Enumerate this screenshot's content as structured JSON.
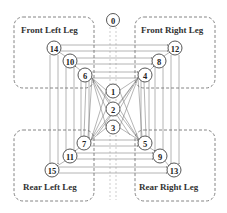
{
  "diagram": {
    "title": "",
    "legs": [
      {
        "id": "front_left",
        "label": "Front Left Leg",
        "nodes": [
          14,
          10,
          6
        ]
      },
      {
        "id": "front_right",
        "label": "Front Right Leg",
        "nodes": [
          12,
          8,
          4
        ]
      },
      {
        "id": "rear_left",
        "label": "Rear Left Leg",
        "nodes": [
          15,
          11,
          7
        ]
      },
      {
        "id": "rear_right",
        "label": "Rear Right Leg",
        "nodes": [
          13,
          9,
          5
        ]
      }
    ],
    "nodes": [
      {
        "id": "0",
        "label": "0",
        "x": 113,
        "y": 20
      },
      {
        "id": "1",
        "label": "1",
        "x": 113,
        "y": 91
      },
      {
        "id": "2",
        "label": "2",
        "x": 113,
        "y": 109
      },
      {
        "id": "3",
        "label": "3",
        "x": 113,
        "y": 127
      },
      {
        "id": "4",
        "label": "4",
        "x": 145,
        "y": 75
      },
      {
        "id": "5",
        "label": "5",
        "x": 145,
        "y": 143
      },
      {
        "id": "6",
        "label": "6",
        "x": 85,
        "y": 75
      },
      {
        "id": "7",
        "label": "7",
        "x": 84,
        "y": 143
      },
      {
        "id": "8",
        "label": "8",
        "x": 159,
        "y": 61
      },
      {
        "id": "9",
        "label": "9",
        "x": 160,
        "y": 156
      },
      {
        "id": "10",
        "label": "10",
        "x": 70,
        "y": 61
      },
      {
        "id": "11",
        "label": "11",
        "x": 70,
        "y": 156
      },
      {
        "id": "12",
        "label": "12",
        "x": 175,
        "y": 48
      },
      {
        "id": "13",
        "label": "13",
        "x": 174,
        "y": 170
      },
      {
        "id": "14",
        "label": "14",
        "x": 54,
        "y": 48
      },
      {
        "id": "15",
        "label": "15",
        "x": 52,
        "y": 170
      }
    ],
    "colors": {
      "stroke": "#444444",
      "edge": "#777777",
      "box": "#666666",
      "text": "#222222"
    }
  }
}
